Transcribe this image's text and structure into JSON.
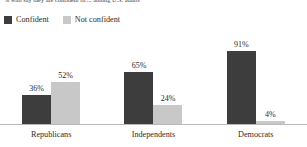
{
  "subtitle": "% who say they are confident in ... among U.S. adults",
  "legend": {
    "items": [
      {
        "label": "Confident",
        "color": "#3d3d3d",
        "swatch": "legend-swatch-confident"
      },
      {
        "label": "Not confident",
        "color": "#c8c8c8",
        "swatch": "legend-swatch-not-confident"
      }
    ]
  },
  "axis": {
    "baseline_color": "#b9b9b9"
  },
  "chart_data": {
    "type": "bar",
    "title": "",
    "subtitle": "% who say they are confident in ... among U.S. adults",
    "xlabel": "",
    "ylabel": "",
    "ylim": [
      0,
      100
    ],
    "grid": false,
    "legend_position": "top-left",
    "value_suffix": "%",
    "categories": [
      "Republicans",
      "Independents",
      "Democrats"
    ],
    "series": [
      {
        "name": "Confident",
        "color": "#3d3d3d",
        "values": [
          36,
          65,
          91
        ],
        "labels": [
          "36%",
          "65%",
          "91%"
        ]
      },
      {
        "name": "Not confident",
        "color": "#c8c8c8",
        "values": [
          52,
          24,
          4
        ],
        "labels": [
          "52%",
          "24%",
          "4%"
        ]
      }
    ]
  }
}
